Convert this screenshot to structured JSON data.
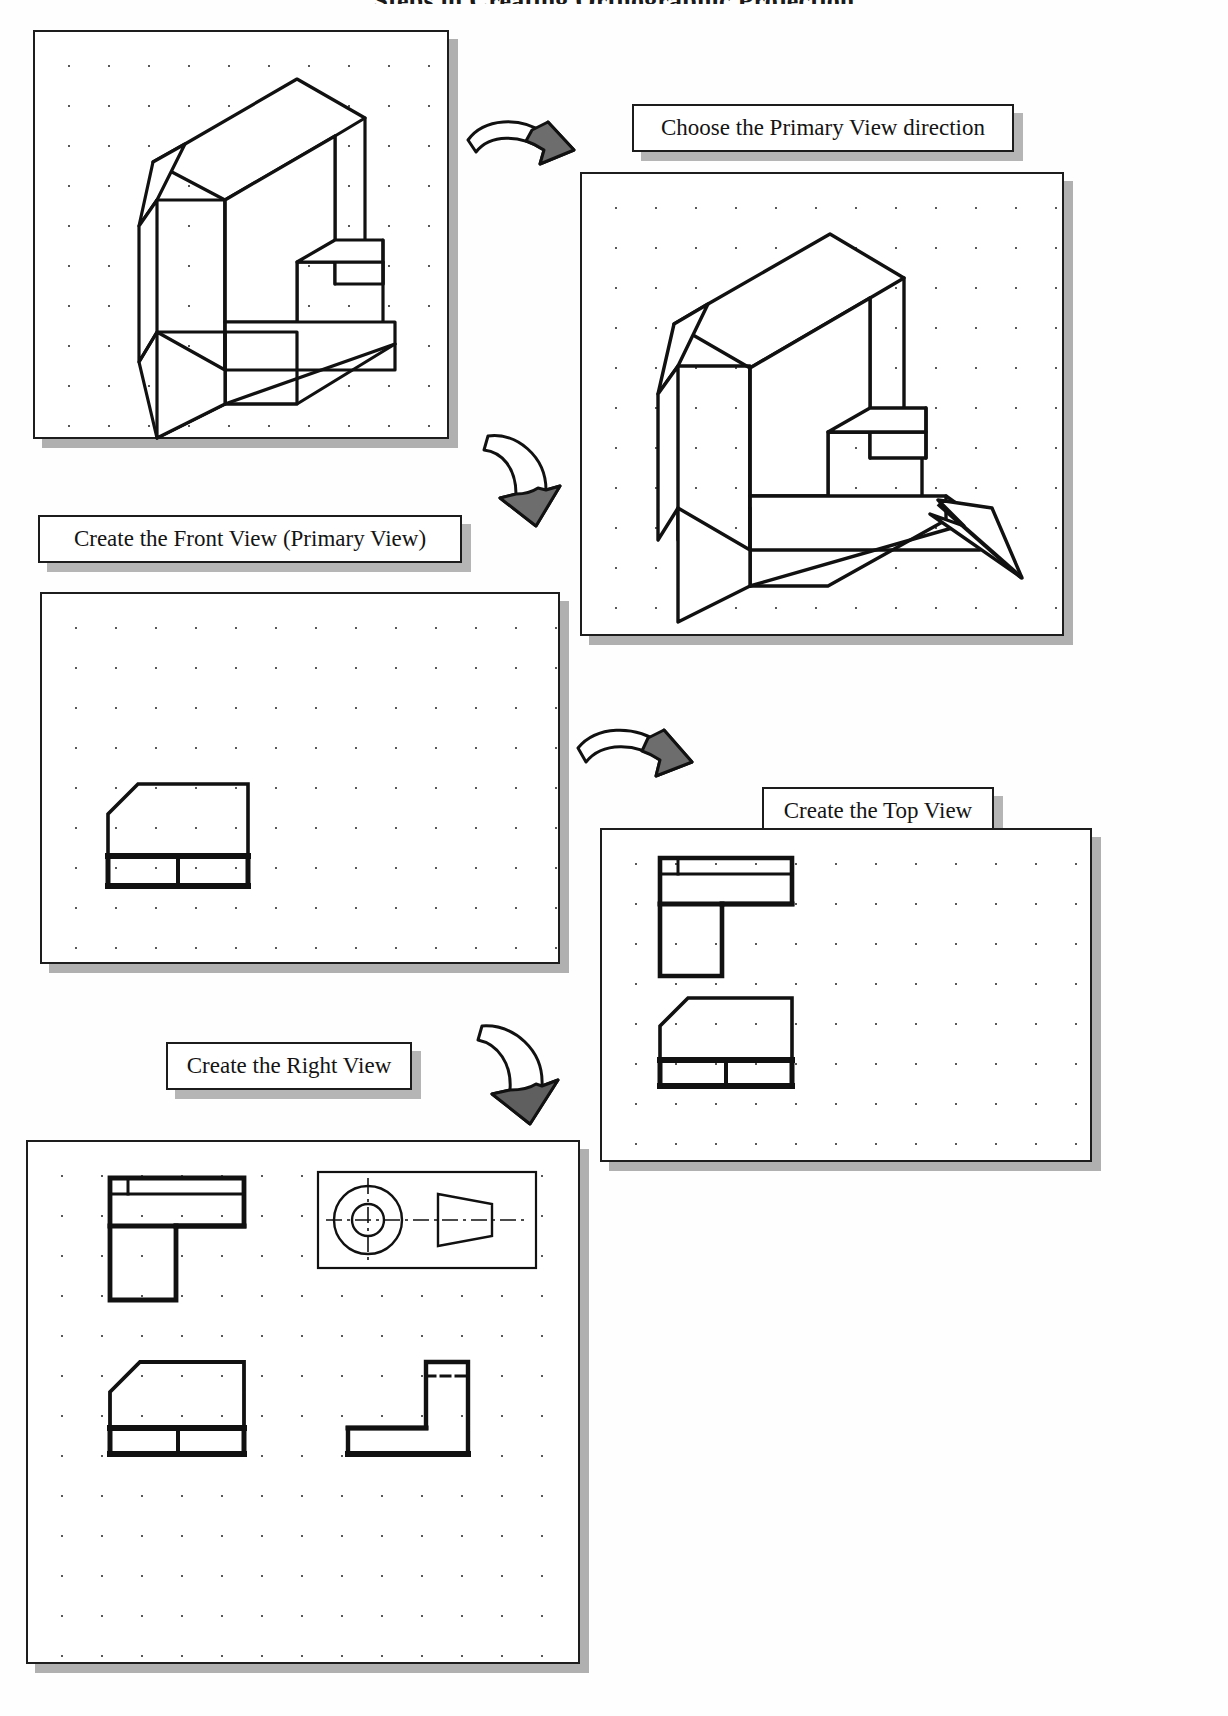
{
  "page": {
    "title": "Steps in Creating Orthographic Projection",
    "background_color": "#ffffff",
    "ink_color": "#1d1d1d",
    "shadow_color": "#a8a8a8"
  },
  "captions": [
    {
      "id": "choose-primary-view",
      "label": "Choose the Primary View direction"
    },
    {
      "id": "create-front-view",
      "label": "Create the Front View (Primary View)"
    },
    {
      "id": "create-top-view",
      "label": "Create the Top View"
    },
    {
      "id": "create-right-view",
      "label": "Create the Right View"
    }
  ],
  "panels": [
    {
      "id": "panel-pictorial",
      "name": "Isometric pictorial of the part",
      "contents": "isometric L-block with chamfered upper-left corner and notch on right face"
    },
    {
      "id": "panel-primary-view",
      "name": "Isometric with view-direction arrow",
      "contents": "same isometric block with a bold arrow indicating the primary (front) viewing direction"
    },
    {
      "id": "panel-front-view",
      "name": "Front view sheet",
      "contents": "front orthographic view only"
    },
    {
      "id": "panel-top-front",
      "name": "Top and front view sheet",
      "contents": "top orthographic view above the front orthographic view"
    },
    {
      "id": "panel-three-view",
      "name": "Three-view sheet",
      "contents": "top view, front view, right side view and a projection-symbol logo box"
    }
  ],
  "arrows": [
    {
      "id": "arrow-1",
      "from": "panel-pictorial",
      "to": "panel-primary-view",
      "glyph": "curved-3d-arrow"
    },
    {
      "id": "arrow-2",
      "from": "panel-primary-view",
      "to": "panel-front-view",
      "glyph": "curved-3d-arrow"
    },
    {
      "id": "arrow-3",
      "from": "panel-front-view",
      "to": "panel-top-front",
      "glyph": "curved-3d-arrow"
    },
    {
      "id": "arrow-4",
      "from": "panel-top-front",
      "to": "panel-three-view",
      "glyph": "curved-3d-arrow"
    }
  ],
  "logo_box": {
    "id": "projection-symbol",
    "name": "first-angle projection symbol",
    "elements": [
      "outer circle",
      "inner circle",
      "truncated cone side view",
      "horizontal centerline",
      "vertical centerline"
    ]
  }
}
